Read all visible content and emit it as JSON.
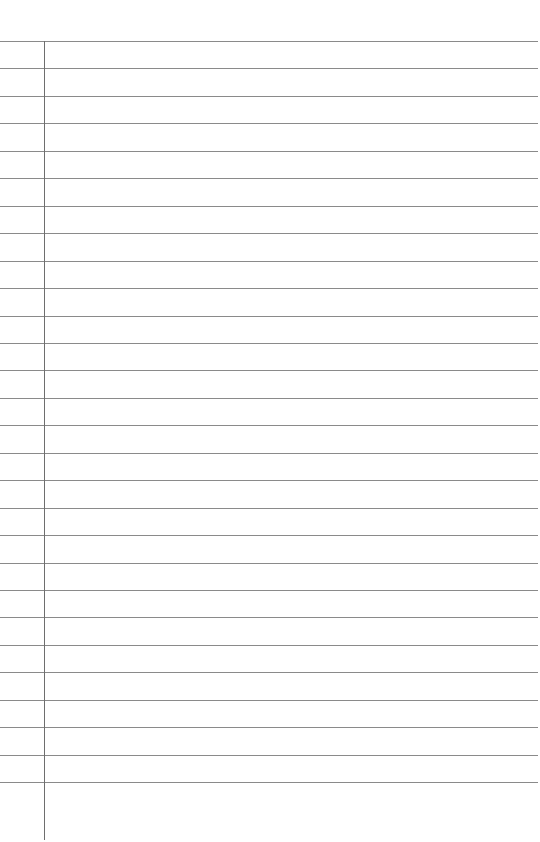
{
  "page": {
    "type": "lined-paper",
    "line_count": 28,
    "first_line_y": 41,
    "line_spacing": 27.45,
    "margin_x": 44,
    "line_color": "#8a8a8a",
    "margin_color": "#6e6e6e"
  }
}
